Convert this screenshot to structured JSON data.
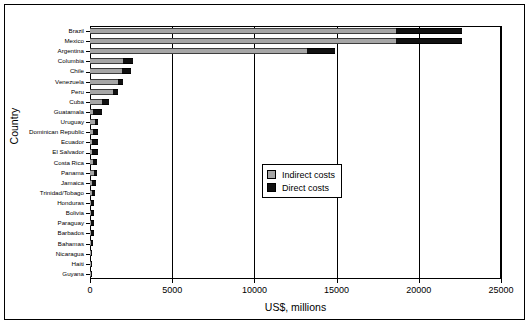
{
  "chart_data": {
    "type": "bar",
    "orientation": "horizontal",
    "stacked": true,
    "title": "",
    "xlabel": "US$, millions",
    "ylabel": "Country",
    "xlim": [
      0,
      25000
    ],
    "xticks": [
      0,
      5000,
      10000,
      15000,
      20000,
      25000
    ],
    "xticklabels": [
      "0",
      "5000",
      "10000",
      "15000",
      "20000",
      "25000"
    ],
    "grid": true,
    "legend": {
      "position": "middle-right-inside",
      "entries": [
        {
          "label": "Indirect costs",
          "color": "#a6a6a6"
        },
        {
          "label": "Direct costs",
          "color": "#111111"
        }
      ]
    },
    "categories": [
      "Brazil",
      "Mexico",
      "Argentina",
      "Columbia",
      "Chile",
      "Venezuela",
      "Peru",
      "Cuba",
      "Guatamala",
      "Uruguay",
      "Dominican Republic",
      "Ecuador",
      "El Salvador",
      "Costa Rica",
      "Panama",
      "Jamaica",
      "Trinidad/Tobago",
      "Honduras",
      "Bolivia",
      "Paraguay",
      "Barbados",
      "Bahamas",
      "Nicaragua",
      "Haiti",
      "Guyana"
    ],
    "series": [
      {
        "name": "Indirect costs",
        "color": "#a6a6a6",
        "values": [
          18600,
          18600,
          13200,
          2000,
          1950,
          1700,
          1380,
          700,
          190,
          330,
          170,
          150,
          130,
          200,
          220,
          110,
          110,
          85,
          85,
          80,
          70,
          65,
          40,
          25,
          20
        ]
      },
      {
        "name": "Direct costs",
        "color": "#111111",
        "values": [
          4030,
          4030,
          1700,
          620,
          560,
          330,
          340,
          440,
          530,
          180,
          330,
          350,
          360,
          250,
          230,
          270,
          200,
          170,
          160,
          160,
          150,
          140,
          55,
          25,
          12
        ]
      }
    ],
    "totals": [
      22630,
      22630,
      14900,
      2620,
      2510,
      2030,
      1720,
      1140,
      720,
      510,
      500,
      500,
      490,
      450,
      450,
      380,
      310,
      255,
      245,
      240,
      220,
      205,
      95,
      50,
      32
    ]
  }
}
